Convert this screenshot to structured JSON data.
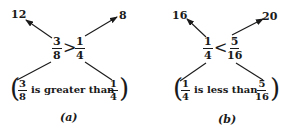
{
  "panels": [
    {
      "label": "(a)",
      "top_left_product": "12",
      "top_right_product": "8",
      "left_fraction": {
        "num": "3",
        "den": "8"
      },
      "relation": ">",
      "right_fraction": {
        "num": "1",
        "den": "4"
      },
      "statement": {
        "open": "(",
        "left": {
          "num": "3",
          "den": "8"
        },
        "text": "is greater than",
        "right": {
          "num": "1",
          "den": "4"
        },
        "close": ")"
      }
    },
    {
      "label": "(b)",
      "top_left_product": "16",
      "top_right_product": "20",
      "left_fraction": {
        "num": "1",
        "den": "4"
      },
      "relation": "<",
      "right_fraction": {
        "num": "5",
        "den": "16"
      },
      "statement": {
        "open": "(",
        "left": {
          "num": "1",
          "den": "4"
        },
        "text": "is less than",
        "right": {
          "num": "5",
          "den": "16"
        },
        "close": ")"
      }
    }
  ],
  "colors": {
    "ink": "#1a1a1a",
    "background": "#ffffff"
  }
}
